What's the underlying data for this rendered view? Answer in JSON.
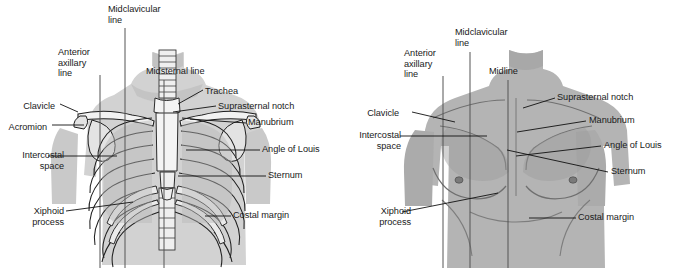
{
  "figure": {
    "background_color": "#ffffff",
    "text_color": "#1a1a1a",
    "leader_line_color": "#111111",
    "reference_line_color": "#555555"
  },
  "panels": [
    {
      "id": "skeletal",
      "name": "Anterior thorax with bony skeleton",
      "silhouette_color": "#d2d2d2",
      "bone_color": "#f2f2f2",
      "shadow_color": "#9b9b9b",
      "labels": [
        {
          "id": "midclavicular-line",
          "text": "Midclavicular\nline",
          "align": "left",
          "x": 108,
          "y": 4
        },
        {
          "id": "anterior-axillary-line",
          "text": "Anterior\naxillary\nline",
          "align": "left",
          "x": 58,
          "y": 47
        },
        {
          "id": "midsternal-line",
          "text": "Midsternal line",
          "align": "left",
          "x": 146,
          "y": 66
        },
        {
          "id": "trachea",
          "text": "Trachea",
          "align": "left",
          "x": 205,
          "y": 86
        },
        {
          "id": "suprasternal-notch",
          "text": "Suprasternal notch",
          "align": "left",
          "x": 218,
          "y": 101
        },
        {
          "id": "clavicle",
          "text": "Clavicle",
          "align": "right",
          "x": 33,
          "y": 101
        },
        {
          "id": "acromion",
          "text": "Acromion",
          "align": "right",
          "x": 10,
          "y": 122
        },
        {
          "id": "manubrium",
          "text": "Manubrium",
          "align": "left",
          "x": 248,
          "y": 120
        },
        {
          "id": "angle-of-louis",
          "text": "Angle of Louis",
          "align": "left",
          "x": 262,
          "y": 146
        },
        {
          "id": "intercostal-space",
          "text": "Intercostal\nspace",
          "align": "right",
          "x": 14,
          "y": 150
        },
        {
          "id": "sternum",
          "text": "Sternum",
          "align": "left",
          "x": 268,
          "y": 172
        },
        {
          "id": "xiphoid-process",
          "text": "Xiphoid\nprocess",
          "align": "right",
          "x": 36,
          "y": 206
        },
        {
          "id": "costal-margin",
          "text": "Costal margin",
          "align": "left",
          "x": 233,
          "y": 212
        }
      ],
      "reference_lines": [
        {
          "id": "anterior-axillary-line",
          "x": 100,
          "y1": 75,
          "y2": 268
        },
        {
          "id": "midclavicular-line",
          "x": 125,
          "y1": 28,
          "y2": 268
        },
        {
          "id": "midsternal-line",
          "x": 164,
          "y1": 80,
          "y2": 268
        }
      ]
    },
    {
      "id": "surface",
      "name": "Anterior thorax surface anatomy",
      "silhouette_color": "#b4b4b4",
      "highlight_color": "#c8c8c8",
      "shadow_color": "#8f8f8f",
      "labels": [
        {
          "id": "midclavicular-line",
          "text": "Midclavicular\nline",
          "align": "left",
          "x": 455,
          "y": 27
        },
        {
          "id": "anterior-axillary-line",
          "text": "Anterior\naxillary\nline",
          "align": "left",
          "x": 404,
          "y": 48
        },
        {
          "id": "midline",
          "text": "Midline",
          "align": "left",
          "x": 489,
          "y": 66
        },
        {
          "id": "suprasternal-notch",
          "text": "Suprasternal notch",
          "align": "left",
          "x": 557,
          "y": 93
        },
        {
          "id": "clavicle",
          "text": "Clavicle",
          "align": "right",
          "x": 384,
          "y": 108
        },
        {
          "id": "manubrium",
          "text": "Manubrium",
          "align": "left",
          "x": 589,
          "y": 117
        },
        {
          "id": "intercostal-space",
          "text": "Intercostal\nspace",
          "align": "right",
          "x": 347,
          "y": 130
        },
        {
          "id": "angle-of-louis",
          "text": "Angle of Louis",
          "align": "left",
          "x": 604,
          "y": 142
        },
        {
          "id": "sternum",
          "text": "Sternum",
          "align": "left",
          "x": 611,
          "y": 168
        },
        {
          "id": "xiphoid-process",
          "text": "Xiphoid\nprocess",
          "align": "right",
          "x": 375,
          "y": 206
        },
        {
          "id": "costal-margin",
          "text": "Costal margin",
          "align": "left",
          "x": 578,
          "y": 213
        }
      ],
      "reference_lines": [
        {
          "id": "anterior-axillary-line",
          "x": 443,
          "y1": 76,
          "y2": 268
        },
        {
          "id": "midclavicular-line",
          "x": 470,
          "y1": 52,
          "y2": 268
        },
        {
          "id": "midline",
          "x": 508,
          "y1": 80,
          "y2": 268
        }
      ]
    }
  ]
}
